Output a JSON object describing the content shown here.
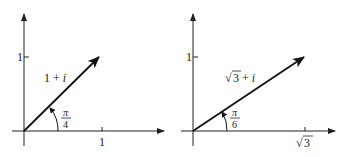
{
  "diagrams": [
    {
      "id": "left",
      "vector_label_prefix": "1 + ",
      "vector_label_imag": "i",
      "angle_num": "π",
      "angle_den": "4",
      "y_tick_label": "1",
      "x_tick_label": "1",
      "angle_deg": 45
    },
    {
      "id": "right",
      "vector_label_sqrt": "√",
      "vector_label_radicand": "3",
      "vector_label_rest": " + ",
      "vector_label_imag": "i",
      "angle_num": "π",
      "angle_den": "6",
      "y_tick_label": "1",
      "x_tick_sqrt": "√",
      "x_tick_radicand": "3",
      "angle_deg": 30
    }
  ],
  "colors": {
    "ink": "#222222",
    "background": "#ffffff"
  }
}
